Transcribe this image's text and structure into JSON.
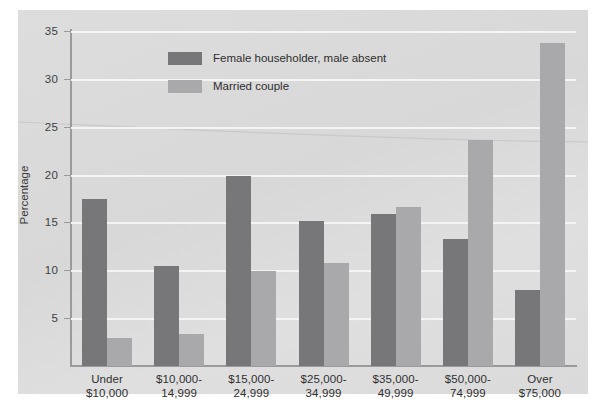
{
  "chart_data": {
    "type": "bar",
    "title": "",
    "xlabel": "",
    "ylabel": "Percentage",
    "ylim": [
      0,
      35
    ],
    "yticks": [
      5,
      10,
      15,
      20,
      25,
      30,
      35
    ],
    "grid": true,
    "legend_position": "top-left-inside",
    "categories": [
      "Under\n$10,000",
      "$10,000-\n14,999",
      "$15,000-\n24,999",
      "$25,000-\n34,999",
      "$35,000-\n49,999",
      "$50,000-\n74,999",
      "Over\n$75,000"
    ],
    "category_lines": [
      [
        "Under",
        "$10,000"
      ],
      [
        "$10,000-",
        "14,999"
      ],
      [
        "$15,000-",
        "24,999"
      ],
      [
        "$25,000-",
        "34,999"
      ],
      [
        "$35,000-",
        "49,999"
      ],
      [
        "$50,000-",
        "74,999"
      ],
      [
        "Over",
        "$75,000"
      ]
    ],
    "series": [
      {
        "name": "Female householder, male absent",
        "color": "#77777a",
        "values": [
          17.5,
          10.4,
          19.9,
          15.2,
          15.9,
          13.3,
          7.9
        ]
      },
      {
        "name": "Married couple",
        "color": "#a9a9ab",
        "values": [
          2.9,
          3.3,
          9.9,
          10.8,
          16.6,
          23.6,
          33.8
        ]
      }
    ]
  },
  "axis": {
    "ytitle": "Percentage",
    "ytick_labels": [
      "5",
      "10",
      "15",
      "20",
      "25",
      "30",
      "35"
    ]
  },
  "legend": {
    "items": [
      {
        "label": "Female householder, male absent",
        "color": "#77777a"
      },
      {
        "label": "Married couple",
        "color": "#a9a9ab"
      }
    ]
  },
  "colors": {
    "panel_background": "#dcdcdc",
    "plot_background": "#dcdcdc",
    "gridline": "#f4f4f4",
    "axis": "#9a9a9a",
    "series_dark": "#77777a",
    "series_light": "#a9a9ab",
    "text": "#303030",
    "page_background": "#ffffff"
  }
}
